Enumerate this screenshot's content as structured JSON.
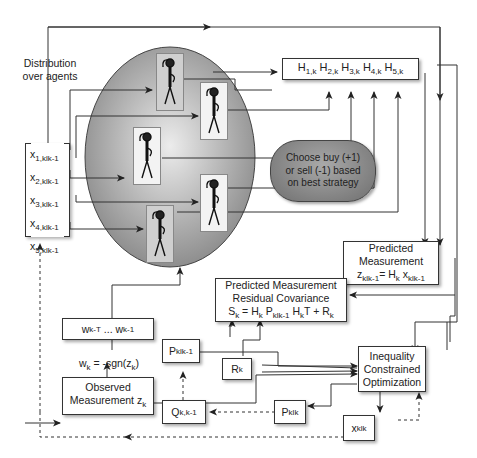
{
  "labels": {
    "distribution": [
      "Distribution",
      "over agents"
    ],
    "weight_rule": {
      "lhs": "w",
      "lhs_sub": "k",
      "rhs": " = -sgn(",
      "rhs_var": "z",
      "rhs_sub": "k",
      "close": ")"
    }
  },
  "state_vector": {
    "items": [
      {
        "var": "x",
        "sub": "1,klk-1"
      },
      {
        "var": "x",
        "sub": "2,klk-1"
      },
      {
        "var": "x",
        "sub": "3,klk-1"
      },
      {
        "var": "x",
        "sub": "4,klk-1"
      },
      {
        "var": "x",
        "sub": "5,klk-1"
      }
    ]
  },
  "agents": {
    "count": 5,
    "icon": "thinking-person-icon"
  },
  "h_vector": {
    "items": [
      {
        "var": "H",
        "sub": "1,k"
      },
      {
        "var": "H",
        "sub": "2,k"
      },
      {
        "var": "H",
        "sub": "3,k"
      },
      {
        "var": "H",
        "sub": "4,k"
      },
      {
        "var": "H",
        "sub": "5,k"
      }
    ]
  },
  "choose_box": {
    "lines": [
      "Choose buy (+1)",
      "or sell (-1) based",
      "on best strategy"
    ]
  },
  "predicted_measurement": {
    "lines": [
      "Predicted",
      "Measurement"
    ],
    "formula": {
      "z": "z",
      "z_sub": "klk-1",
      "eq": "= H",
      "h_sub": "k",
      "x": " x",
      "x_sub": "klk-1"
    }
  },
  "residual_cov": {
    "lines": [
      "Predicted Measurement",
      "Residual Covariance"
    ],
    "formula": {
      "s": "S",
      "s_sub": "k",
      "eq1": " = H",
      "h_sub": "k",
      "p": " P",
      "p_sub": "klk-1",
      "h2": " H",
      "h2_sub": "k",
      "t": "T + R",
      "r_sub": "k"
    }
  },
  "weights_box": {
    "w1": "w",
    "w1_sub": "k-T",
    "dots": " ... ",
    "w2": "w",
    "w2_sub": "k-1"
  },
  "observed": {
    "lines": [
      "Observed"
    ],
    "line2": "Measurement z",
    "sub": "k"
  },
  "p_prior": {
    "var": "P",
    "sub": "klk-1"
  },
  "r_box": {
    "var": "R",
    "sub": "k"
  },
  "q_box": {
    "var": "Q",
    "sub": "k,k-1"
  },
  "p_post": {
    "var": "P",
    "sub": "klk"
  },
  "x_post": {
    "var": "x",
    "sub": "klk"
  },
  "optimizer": {
    "lines": [
      "Inequality",
      "Constrained",
      "Optimization"
    ]
  },
  "colors": {
    "ellipse_center": "#e9e9e9",
    "ellipse_edge": "#8e8e8e",
    "line": "#333333",
    "choose_fill": "#8a8a8a"
  }
}
